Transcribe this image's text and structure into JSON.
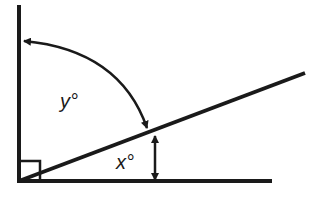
{
  "diagram": {
    "type": "geometry-angle-diagram",
    "labels": {
      "y_angle": "y°",
      "x_angle": "x°"
    },
    "elements": [
      {
        "name": "vertical-line",
        "from": [
          19,
          5
        ],
        "to": [
          19,
          181
        ]
      },
      {
        "name": "baseline",
        "from": [
          19,
          181
        ],
        "to": [
          272,
          181
        ]
      },
      {
        "name": "diagonal-line",
        "from": [
          19,
          181
        ],
        "to": [
          305,
          73
        ]
      },
      {
        "name": "right-angle-marker",
        "x": 19,
        "y": 160,
        "size": 21
      },
      {
        "name": "y-arc-arrow",
        "from": [
          24,
          41
        ],
        "to": [
          147,
          128
        ],
        "double_headed": true
      },
      {
        "name": "x-arrow",
        "from": [
          155,
          136
        ],
        "to": [
          155,
          181
        ],
        "double_headed": true
      }
    ],
    "colors": {
      "stroke": "#1a1a1a",
      "background": "#ffffff"
    }
  }
}
